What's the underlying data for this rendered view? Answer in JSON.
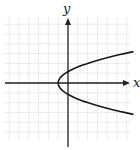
{
  "diagram": {
    "type": "coordinate-graph",
    "x_axis_label": "x",
    "y_axis_label": "y",
    "curve": {
      "description": "sideways parabola opening right",
      "vertex": [
        -1,
        0
      ],
      "equation_approx": "x = 0.75 y^2 - 1",
      "y_intercepts_approx": [
        1.15,
        -1.15
      ]
    },
    "grid": {
      "x_range": [
        -6.5,
        6.2
      ],
      "y_range": [
        -5.8,
        6.8
      ],
      "spacing_units": 1
    },
    "colors": {
      "grid": "#b8b8b8",
      "axes": "#222222",
      "curve": "#1a1a1a",
      "background": "#ffffff"
    }
  }
}
